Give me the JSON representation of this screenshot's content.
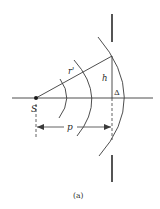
{
  "figure": {
    "caption": "(a)",
    "labels": {
      "source": "S",
      "radius": "r'",
      "height": "h",
      "sagitta": "Δ",
      "distance": "p"
    },
    "colors": {
      "line": "#3a3a3a",
      "background": "#ffffff"
    }
  },
  "geometry": {
    "source_point": [
      36,
      98
    ],
    "axis": {
      "x1": 12,
      "x2": 153,
      "y": 98
    },
    "radius_line": {
      "from": [
        36,
        98
      ],
      "to": [
        112,
        56
      ]
    },
    "height_line": {
      "x": 112,
      "y1": 56,
      "y2": 98
    },
    "screen_top": {
      "x": 112,
      "y1": 14,
      "y2": 42
    },
    "screen_bottom": {
      "x": 112,
      "y1": 155,
      "y2": 182
    },
    "arcs": [
      {
        "name": "inner",
        "start": [
          60,
          79
        ],
        "mid": [
          68,
          98
        ],
        "end": [
          59,
          118
        ]
      },
      {
        "name": "middle",
        "start": [
          74,
          60
        ],
        "mid": [
          92,
          98
        ],
        "end": [
          77,
          136
        ]
      },
      {
        "name": "outer",
        "start": [
          98,
          37
        ],
        "mid": [
          124,
          98
        ],
        "end": [
          99,
          156
        ]
      }
    ],
    "dimension_p": {
      "x1": 37,
      "x2": 111,
      "y": 127
    }
  }
}
